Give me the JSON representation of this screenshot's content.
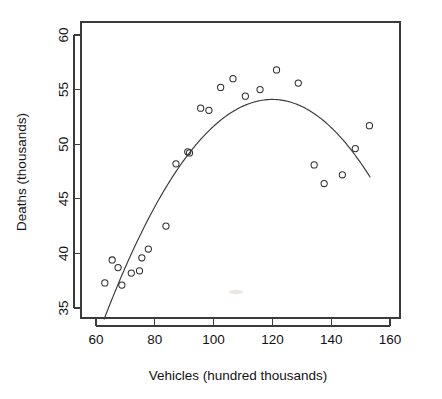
{
  "chart_data": {
    "type": "scatter",
    "title": "",
    "xlabel": "Vehicles (hundred thousands)",
    "ylabel": "Deaths (thousands)",
    "xlim": [
      57.5,
      163
    ],
    "ylim": [
      33.6,
      61.2
    ],
    "xticks": [
      60,
      80,
      100,
      120,
      140,
      160
    ],
    "yticks": [
      35,
      40,
      45,
      50,
      55,
      60
    ],
    "xtick_labels": [
      "60",
      "80",
      "100",
      "120",
      "140",
      "160"
    ],
    "ytick_labels": [
      "35",
      "40",
      "45",
      "50",
      "55",
      "60"
    ],
    "grid": false,
    "legend": "none",
    "box": true,
    "points": [
      {
        "x": 63.0,
        "y": 37.3
      },
      {
        "x": 65.5,
        "y": 39.4
      },
      {
        "x": 67.5,
        "y": 38.7
      },
      {
        "x": 68.8,
        "y": 37.1
      },
      {
        "x": 72.0,
        "y": 38.2
      },
      {
        "x": 74.8,
        "y": 38.4
      },
      {
        "x": 75.6,
        "y": 39.6
      },
      {
        "x": 77.8,
        "y": 40.4
      },
      {
        "x": 83.8,
        "y": 42.5
      },
      {
        "x": 87.2,
        "y": 48.2
      },
      {
        "x": 91.2,
        "y": 49.3
      },
      {
        "x": 91.8,
        "y": 49.2
      },
      {
        "x": 95.6,
        "y": 53.3
      },
      {
        "x": 98.4,
        "y": 53.1
      },
      {
        "x": 102.4,
        "y": 55.2
      },
      {
        "x": 106.6,
        "y": 56.0
      },
      {
        "x": 110.8,
        "y": 54.4
      },
      {
        "x": 115.8,
        "y": 55.0
      },
      {
        "x": 121.4,
        "y": 56.8
      },
      {
        "x": 128.8,
        "y": 55.6
      },
      {
        "x": 134.2,
        "y": 48.1
      },
      {
        "x": 137.6,
        "y": 46.4
      },
      {
        "x": 143.8,
        "y": 47.2
      },
      {
        "x": 148.2,
        "y": 49.6
      },
      {
        "x": 153.0,
        "y": 51.7
      }
    ],
    "fit": {
      "kind": "quadratic",
      "description": "fitted quadratic curve peaking near x = 120",
      "xrange": [
        62.8,
        153.2
      ],
      "vertex": {
        "x": 120.0,
        "y": 54.1
      },
      "endpoints": [
        {
          "x": 62.8,
          "y": 34.0
        },
        {
          "x": 153.2,
          "y": 47.0
        }
      ]
    },
    "marker": {
      "shape": "open-circle",
      "radius_px": 3.1,
      "color": "#2e2e2e"
    },
    "curve_color": "#3a3a3a"
  }
}
